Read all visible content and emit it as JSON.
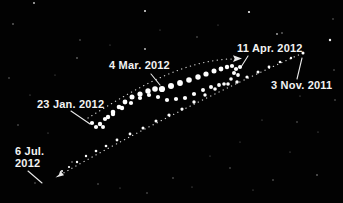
{
  "figure": {
    "labels": {
      "mar4": {
        "text": "4 Mar. 2012"
      },
      "apr11": {
        "text": "11 Apr. 2012"
      },
      "nov3": {
        "text": "3 Nov. 2011"
      },
      "jan23": {
        "text": "23 Jan. 2012"
      },
      "jul6_line1": {
        "text": "6 Jul."
      },
      "jul6_line2": {
        "text": "2012"
      }
    },
    "colors": {
      "background": "#020202",
      "dots": "#ffffff",
      "text": "#f2f2f2",
      "track": "#dcdcdc"
    },
    "paths": {
      "prograde_track": "M60,175 C130,135 220,90 303,53",
      "retrograde_track": "M88,118 C130,92 185,58 236,59"
    },
    "mars_positions": {
      "nov3_point": [
        303,
        53,
        1.5
      ],
      "approach": [
        [
          291,
          58,
          1.2
        ],
        [
          280,
          62,
          1.3
        ],
        [
          269,
          67,
          1.4
        ],
        [
          258,
          72,
          1.5
        ],
        [
          247,
          77,
          1.6
        ],
        [
          237,
          82,
          1.7
        ],
        [
          228,
          84,
          1.8
        ],
        [
          219,
          85,
          1.9
        ],
        [
          211,
          87,
          2.0
        ],
        [
          203,
          90,
          2.0
        ],
        [
          194,
          94,
          2.1
        ],
        [
          185,
          98,
          2.1
        ],
        [
          176,
          99,
          2.1
        ],
        [
          167,
          100,
          2.1
        ],
        [
          158,
          97,
          2.1
        ],
        [
          149,
          95,
          2.1
        ],
        [
          140,
          98,
          2.1
        ],
        [
          131,
          103,
          2.1
        ],
        [
          122,
          108,
          2.2
        ],
        [
          113,
          114,
          2.2
        ],
        [
          105,
          119,
          2.1
        ]
      ],
      "retrograde": [
        [
          92,
          123,
          2.1
        ],
        [
          96,
          127,
          2.1
        ],
        [
          100,
          124,
          2.2
        ],
        [
          103,
          127,
          2.0
        ],
        [
          108,
          117,
          2.2
        ],
        [
          113,
          112,
          2.3
        ],
        [
          119,
          107,
          2.3
        ],
        [
          125,
          102,
          2.4
        ],
        [
          132,
          97,
          2.5
        ],
        [
          140,
          94,
          2.6
        ],
        [
          148,
          91,
          2.7
        ],
        [
          155,
          89,
          2.8
        ],
        [
          162,
          89,
          3.1
        ],
        [
          171,
          86,
          3.0
        ],
        [
          180,
          83,
          2.9
        ],
        [
          189,
          80,
          2.8
        ],
        [
          198,
          77,
          2.7
        ],
        [
          206,
          74,
          2.6
        ],
        [
          214,
          71,
          2.5
        ],
        [
          221,
          69,
          2.4
        ],
        [
          227,
          67,
          2.2
        ],
        [
          232,
          66,
          2.1
        ],
        [
          236,
          69,
          2.1
        ],
        [
          240,
          67,
          2.0
        ],
        [
          234,
          73,
          2.0
        ],
        [
          238,
          75,
          1.9
        ]
      ],
      "departure": [
        [
          231,
          79,
          1.8
        ],
        [
          224,
          84,
          1.8
        ],
        [
          215,
          89,
          1.8
        ],
        [
          205,
          95,
          1.7
        ],
        [
          194,
          102,
          1.7
        ],
        [
          182,
          109,
          1.6
        ],
        [
          169,
          115,
          1.6
        ],
        [
          156,
          121,
          1.5
        ],
        [
          143,
          128,
          1.5
        ],
        [
          130,
          134,
          1.4
        ],
        [
          117,
          140,
          1.4
        ],
        [
          106,
          146,
          1.3
        ],
        [
          96,
          151,
          1.3
        ],
        [
          86,
          156,
          1.2
        ],
        [
          77,
          162,
          1.2
        ],
        [
          69,
          167,
          1.1
        ],
        [
          62,
          171,
          1.0
        ]
      ]
    },
    "stars": [
      [
        34,
        3,
        0.9,
        0.8
      ],
      [
        145,
        11,
        1.0,
        0.9
      ],
      [
        249,
        12,
        1.1,
        0.95
      ],
      [
        13,
        24,
        0.8,
        0.6
      ],
      [
        80,
        40,
        0.7,
        0.5
      ],
      [
        277,
        34,
        0.9,
        0.7
      ],
      [
        330,
        40,
        1.2,
        0.95
      ],
      [
        145,
        49,
        0.9,
        0.8
      ],
      [
        77,
        58,
        0.8,
        0.6
      ],
      [
        197,
        37,
        0.7,
        0.5
      ],
      [
        282,
        33,
        0.8,
        0.6
      ],
      [
        333,
        19,
        0.7,
        0.5
      ],
      [
        218,
        25,
        0.6,
        0.4
      ],
      [
        160,
        30,
        0.6,
        0.4
      ],
      [
        110,
        45,
        0.6,
        0.4
      ],
      [
        9,
        78,
        0.7,
        0.5
      ],
      [
        30,
        95,
        0.6,
        0.45
      ],
      [
        18,
        125,
        0.7,
        0.5
      ],
      [
        48,
        133,
        0.6,
        0.45
      ],
      [
        55,
        75,
        0.6,
        0.4
      ],
      [
        72,
        162,
        0.8,
        0.6
      ],
      [
        35,
        183,
        0.7,
        0.5
      ],
      [
        98,
        184,
        0.7,
        0.5
      ],
      [
        120,
        188,
        0.6,
        0.45
      ],
      [
        147,
        193,
        0.7,
        0.5
      ],
      [
        173,
        178,
        0.7,
        0.55
      ],
      [
        192,
        187,
        0.6,
        0.45
      ],
      [
        230,
        168,
        0.7,
        0.5
      ],
      [
        253,
        190,
        0.6,
        0.45
      ],
      [
        273,
        180,
        0.7,
        0.55
      ],
      [
        317,
        175,
        0.8,
        0.6
      ],
      [
        297,
        122,
        0.7,
        0.5
      ],
      [
        318,
        132,
        0.6,
        0.45
      ],
      [
        335,
        100,
        0.7,
        0.5
      ],
      [
        262,
        120,
        0.6,
        0.45
      ],
      [
        290,
        152,
        0.6,
        0.45
      ],
      [
        210,
        156,
        0.6,
        0.4
      ],
      [
        240,
        142,
        0.6,
        0.4
      ],
      [
        334,
        70,
        0.7,
        0.5
      ],
      [
        300,
        96,
        0.6,
        0.45
      ]
    ]
  }
}
